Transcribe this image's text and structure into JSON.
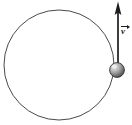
{
  "figure": {
    "canvas": {
      "width": 132,
      "height": 125,
      "background": "#ffffff"
    },
    "colors": {
      "stroke": "#4a4a4a",
      "dark_stroke": "#1c1c1c",
      "ball_light": "#e8e8e8",
      "ball_mid": "#9a9a9a",
      "ball_dark": "#4f4f4f",
      "ball_edge": "#2e2e2e",
      "radius_line": "#7a7a7a"
    },
    "orbit_circle": {
      "name": "circular path",
      "center_x": 59,
      "center_y": 65,
      "radius": 55,
      "stroke_width": 1
    },
    "radius_line": {
      "name": "radius",
      "x1": 55,
      "y1": 70,
      "x2": 114,
      "y2": 70,
      "stroke_width": 1.4
    },
    "ball": {
      "name": "ball",
      "center_x": 117,
      "center_y": 70,
      "radius": 7.5,
      "highlight_x": 114,
      "highlight_y": 66
    },
    "velocity_vector": {
      "name": "velocity vector",
      "label": "v",
      "tail_x": 118,
      "tail_y": 62,
      "head_x": 118,
      "head_y": 2,
      "shaft_width": 1.6,
      "head_width": 6,
      "head_length": 13,
      "direction": "up",
      "label_x": 121,
      "label_y": 25
    }
  }
}
